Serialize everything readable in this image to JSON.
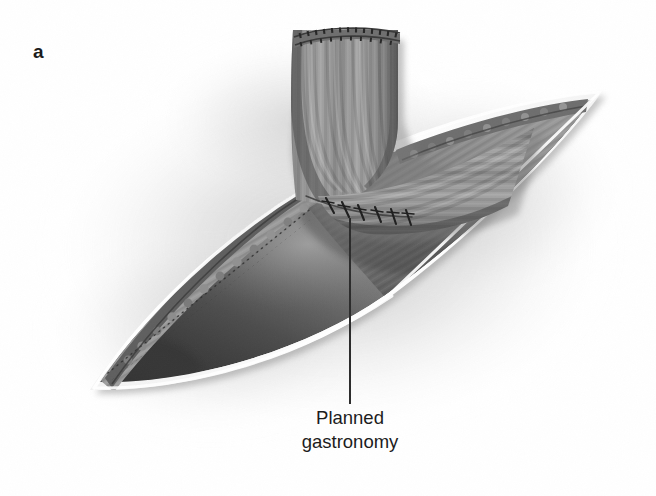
{
  "figure": {
    "panel_letter": "a",
    "kind": "surgical-illustration",
    "modality": "grayscale line-and-tone medical drawing",
    "background_color": "#ffffff"
  },
  "annotations": {
    "callout": {
      "line1": "Planned",
      "line2": "gastronomy",
      "leader_line": {
        "color": "#2b2b2b",
        "x": 350,
        "y_top": 218,
        "y_bottom": 404,
        "width": 2
      }
    }
  },
  "palette": {
    "background": "#ffffff",
    "halo_shadow": "#b9b9b9",
    "serosa_rim_white": "#fdfdfd",
    "organ_wall_light": "#c9c9c9",
    "organ_wall_mid": "#9a9a9a",
    "cavity_light": "#a3a3a3",
    "cavity_mid": "#7d7d7d",
    "cavity_dark": "#4e4e4e",
    "cavity_deep": "#3a3a3a",
    "bowel_light": "#b4b4b4",
    "bowel_mid": "#8a8a8a",
    "bowel_dark": "#5f5f5f",
    "bowel_shadow": "#474747",
    "staple_line": "#4a4a4a",
    "suture_black": "#1f1f1f",
    "mucosa_scallop": "#6a6a6a",
    "text": "#1c1c1c"
  },
  "anatomy": {
    "stomach_opening": {
      "name": "opened stomach (gastrotomy leaf)",
      "shape": "lens / leaf",
      "left_tip": [
        90,
        390
      ],
      "right_tip": [
        602,
        92
      ],
      "rim_style": "bright white serosal border",
      "rim_width_px": 6
    },
    "roux_limb": {
      "name": "roux bowel limb",
      "description": "tubular bowel loop curving from upper area down and to the right",
      "stapled_end": {
        "label": "stapled transected bowel end",
        "rows": 2,
        "position": [
          345,
          38
        ]
      },
      "striations": "longitudinal banded shading along the tube"
    },
    "anastomosis": {
      "label": "interrupted sutures at bowel-to-stomach junction",
      "suture_count": 6,
      "sutures": [
        {
          "x": 330,
          "y": 206,
          "angle": -28
        },
        {
          "x": 345,
          "y": 210,
          "angle": -22
        },
        {
          "x": 360,
          "y": 212,
          "angle": -20
        },
        {
          "x": 377,
          "y": 214,
          "angle": -16
        },
        {
          "x": 392,
          "y": 216,
          "angle": -14
        },
        {
          "x": 406,
          "y": 216,
          "angle": -12
        }
      ]
    },
    "mucosal_edge": {
      "label": "scalloped mucosal edge with staple lines",
      "location": "upper-left wall of the opened stomach"
    }
  }
}
